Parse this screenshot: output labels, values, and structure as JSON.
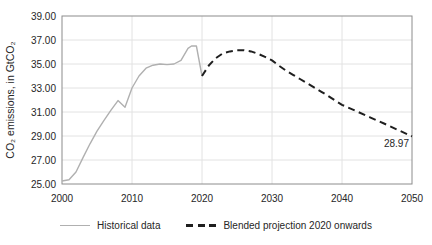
{
  "chart_data": {
    "type": "line",
    "title": "",
    "xlabel": "",
    "ylabel": "CO₂ emissions, in GtCO₂",
    "x_range": [
      2000,
      2050
    ],
    "y_range": [
      25,
      39
    ],
    "grid": true,
    "legend_position": "bottom-center",
    "colors": {
      "historical": "#b0b0b0",
      "projection": "#1f1f1f",
      "gridline": "#e2e2e2",
      "frame": "#8c8c8c",
      "text": "#262626"
    },
    "y_ticks": [
      {
        "v": 25,
        "label": "25.00"
      },
      {
        "v": 27,
        "label": "27.00"
      },
      {
        "v": 29,
        "label": "29.00"
      },
      {
        "v": 31,
        "label": "31.00"
      },
      {
        "v": 33,
        "label": "33.00"
      },
      {
        "v": 35,
        "label": "35.00"
      },
      {
        "v": 37,
        "label": "37.00"
      },
      {
        "v": 39,
        "label": "39.00"
      }
    ],
    "x_ticks": [
      {
        "v": 2000,
        "label": "2000"
      },
      {
        "v": 2010,
        "label": "2010"
      },
      {
        "v": 2020,
        "label": "2020"
      },
      {
        "v": 2030,
        "label": "2030"
      },
      {
        "v": 2040,
        "label": "2040"
      },
      {
        "v": 2050,
        "label": "2050"
      }
    ],
    "series": [
      {
        "name": "Historical data",
        "style": "solid",
        "color": "#b0b0b0",
        "points": [
          [
            2000,
            25.25
          ],
          [
            2001,
            25.35
          ],
          [
            2002,
            26.0
          ],
          [
            2003,
            27.2
          ],
          [
            2004,
            28.35
          ],
          [
            2005,
            29.4
          ],
          [
            2006,
            30.3
          ],
          [
            2007,
            31.15
          ],
          [
            2008,
            31.95
          ],
          [
            2009,
            31.4
          ],
          [
            2010,
            33.0
          ],
          [
            2011,
            34.0
          ],
          [
            2012,
            34.65
          ],
          [
            2013,
            34.9
          ],
          [
            2014,
            35.0
          ],
          [
            2015,
            34.95
          ],
          [
            2016,
            35.0
          ],
          [
            2017,
            35.3
          ],
          [
            2018,
            36.3
          ],
          [
            2018.5,
            36.5
          ],
          [
            2019.2,
            36.5
          ],
          [
            2020,
            34.0
          ]
        ]
      },
      {
        "name": "Blended projection 2020 onwards",
        "style": "dashed",
        "color": "#1f1f1f",
        "points": [
          [
            2020,
            34.0
          ],
          [
            2021,
            34.9
          ],
          [
            2022,
            35.5
          ],
          [
            2023,
            35.9
          ],
          [
            2024,
            36.05
          ],
          [
            2025,
            36.15
          ],
          [
            2026,
            36.15
          ],
          [
            2027,
            36.05
          ],
          [
            2028,
            35.85
          ],
          [
            2029,
            35.6
          ],
          [
            2030,
            35.3
          ],
          [
            2031,
            34.85
          ],
          [
            2032,
            34.45
          ],
          [
            2033,
            34.1
          ],
          [
            2034,
            33.75
          ],
          [
            2035,
            33.4
          ],
          [
            2036,
            33.05
          ],
          [
            2037,
            32.7
          ],
          [
            2038,
            32.35
          ],
          [
            2039,
            31.97
          ],
          [
            2040,
            31.6
          ],
          [
            2042,
            31.08
          ],
          [
            2044,
            30.56
          ],
          [
            2046,
            30.04
          ],
          [
            2048,
            29.5
          ],
          [
            2050,
            28.97
          ]
        ]
      }
    ],
    "annotation": {
      "text": "28.97"
    }
  }
}
